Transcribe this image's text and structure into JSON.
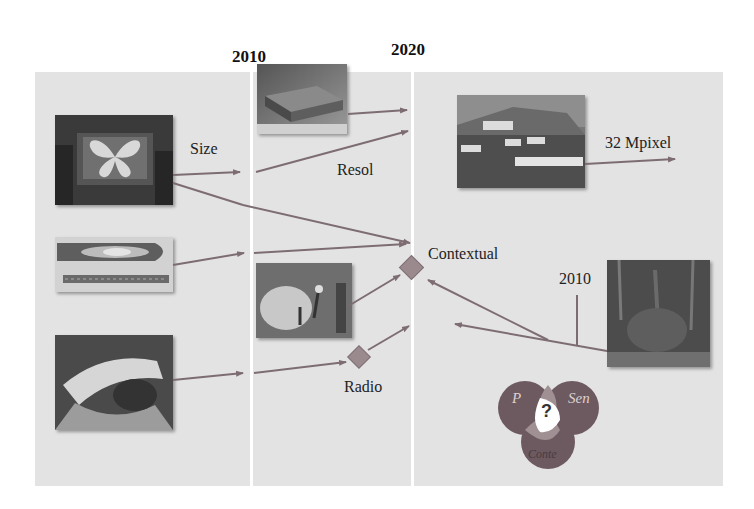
{
  "timeline": {
    "year_left": "2010",
    "year_right": "2020"
  },
  "labels": {
    "size": "Size",
    "resol": "Resol",
    "mpixel": "32 Mpixel",
    "contextual": "Contextual",
    "radio": "Radio",
    "year_inner": "2010"
  },
  "venn": {
    "left": "P",
    "right": "Sen",
    "bottom": "Conte",
    "center": "?"
  },
  "images": [
    {
      "id": "large-display",
      "desc": "Large display showing butterfly image"
    },
    {
      "id": "flexible-display",
      "desc": "Flexible oval display strip"
    },
    {
      "id": "paper-display-hand",
      "desc": "Hand holding flexible paper display"
    },
    {
      "id": "display-slab",
      "desc": "3D display slab"
    },
    {
      "id": "people-scene",
      "desc": "People in an outdoor scene"
    },
    {
      "id": "labeled-landscape",
      "desc": "Landscape photo with annotation labels"
    },
    {
      "id": "dark-texture",
      "desc": "Dark textured image"
    }
  ],
  "colors": {
    "panel": "#e3e3e3",
    "arrow": "#7d6d73",
    "diamond": "#9a8a8e",
    "venn_dark": "#6d5a60",
    "venn_mid": "#a08f93"
  }
}
